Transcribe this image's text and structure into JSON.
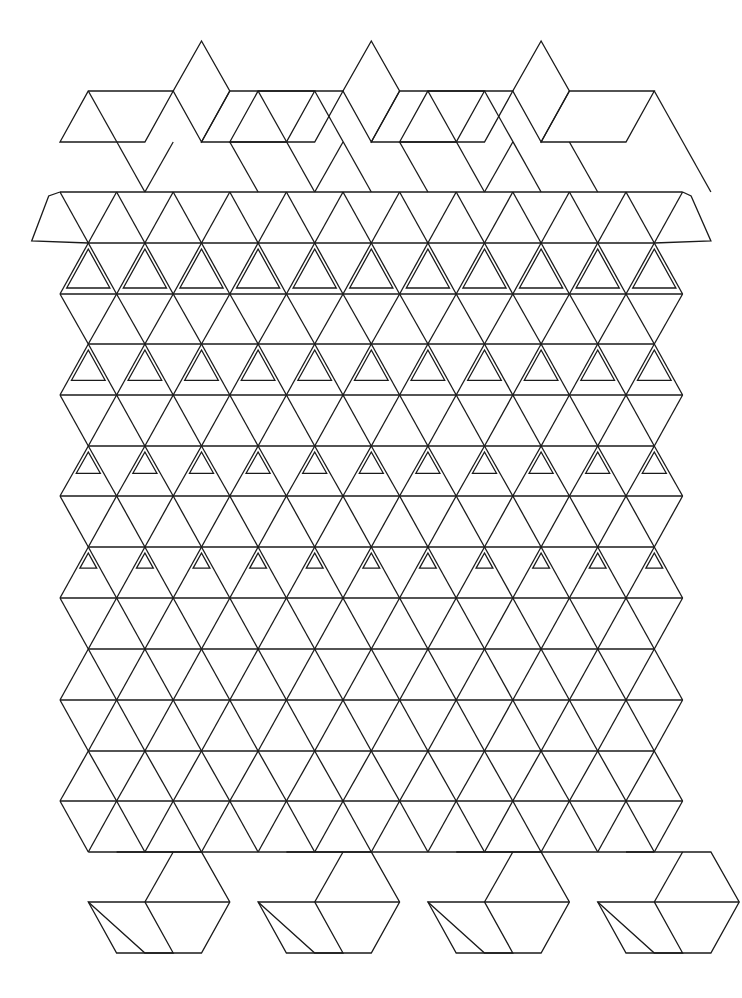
{
  "artwork": {
    "title": "Geometric tessellation: stars and cubes metamorphosing into triangles and cubes",
    "background": "#ffffff",
    "stroke_color": "#1a1a1a",
    "stroke_width": 1.3
  },
  "lattice": {
    "x0": 60,
    "half_step": 28.3,
    "y_rows": [
      41,
      91,
      142,
      192,
      243,
      294,
      344,
      395,
      446,
      496,
      547,
      598,
      649,
      700,
      751,
      801,
      852,
      902,
      953
    ],
    "columns": 11,
    "triangle_zone_rows": [
      3,
      16
    ]
  },
  "top_cubes": {
    "peaks_x": [
      200,
      370,
      540
    ],
    "peak_y": 41
  },
  "bottom_cubes": {
    "centers_x": [
      117,
      287,
      457,
      627
    ],
    "bottom_y": 953
  },
  "star_zone": {
    "rows": [
      4,
      6,
      8,
      10
    ],
    "inset": 6
  }
}
